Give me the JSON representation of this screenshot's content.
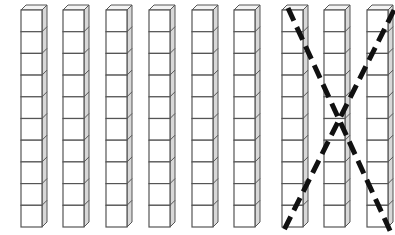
{
  "diagram": {
    "title": "Base-ten rods: 9 tens with 3 crossed out",
    "rods": {
      "count": 9,
      "cubes_per_rod": 10,
      "crossed_out": [
        7,
        8,
        9
      ],
      "left_edges": [
        21,
        63,
        106,
        149,
        192,
        234,
        282,
        324,
        367
      ],
      "top": 10,
      "bottom": 227,
      "face_width": 21,
      "side_depth": 5
    },
    "cross_mark": {
      "style": "dashed",
      "color": "#111111",
      "lines": [
        {
          "x1": 288,
          "y1": 8,
          "x2": 392,
          "y2": 235
        },
        {
          "x1": 394,
          "y1": 10,
          "x2": 284,
          "y2": 230
        }
      ]
    },
    "colors": {
      "face": "#ffffff",
      "side": "#d8d8d8",
      "top": "#f4f4f4",
      "stroke": "#555555"
    }
  }
}
